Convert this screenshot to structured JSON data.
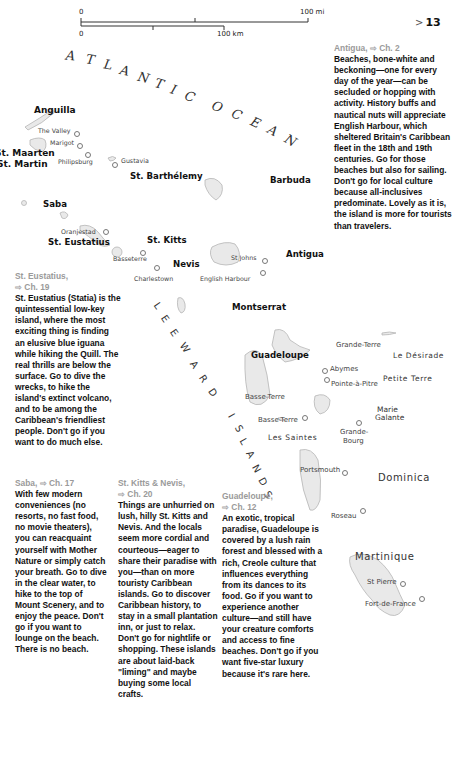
{
  "scale_bar": {
    "miles_start": "0",
    "miles_end": "100 mi",
    "km_start": "0",
    "km_end": "100 km"
  },
  "page_number": {
    "arrow": ">",
    "number": "13"
  },
  "water_labels": {
    "ocean_line1": [
      "A",
      "T",
      "L",
      "A",
      "N",
      "T",
      "I",
      "C"
    ],
    "ocean_line2": [
      "O",
      "C",
      "E",
      "A",
      "N"
    ],
    "islands_arc_1": [
      "L",
      "E",
      "E",
      "W",
      "A",
      "R",
      "D"
    ],
    "islands_arc_2": [
      "I",
      "S",
      "L",
      "A",
      "N",
      "D",
      "S"
    ]
  },
  "islands": {
    "anguilla": "Anguilla",
    "st_maarten": "St. Maarten",
    "st_martin": "St. Martin",
    "st_barthelemy": "St. Barthélemy",
    "barbuda": "Barbuda",
    "saba": "Saba",
    "st_eustatius": "St. Eustatius",
    "st_kitts": "St. Kitts",
    "nevis": "Nevis",
    "antigua": "Antigua",
    "montserrat": "Montserrat",
    "guadeloupe": "Guadeloupe",
    "grande_terre": "Grande-Terre",
    "le_desirade": "Le Désirade",
    "petite_terre": "Petite Terre",
    "basse_terre_region": "Basse-Terre",
    "marie_galante_1": "Marie",
    "marie_galante_2": "Galante",
    "les_saintes": "Les Saintes",
    "dominica": "Dominica",
    "martinique": "Martinique"
  },
  "towns": {
    "the_valley": "The Valley",
    "marigot": "Marigot",
    "philipsburg": "Philipsburg",
    "gustavia": "Gustavia",
    "oranjestad": "Oranjestad",
    "basseterre": "Basseterre",
    "charlestown": "Charlestown",
    "st_johns": "St Johns",
    "english_harbour": "English Harbour",
    "abymes": "Abymes",
    "pointe_a_pitre": "Pointe-à-Pitre",
    "basse_terre_town": "Basse-Terre",
    "grande_bourg_1": "Grande-",
    "grande_bourg_2": "Bourg",
    "portsmouth": "Portsmouth",
    "roseau": "Roseau",
    "st_pierre": "St Pierre",
    "fort_de_france": "Fort-de-France"
  },
  "descriptions": {
    "antigua": {
      "title": "Antigua,",
      "chapter": "Ch. 2",
      "text": "Beaches, bone-white and beckoning—one for every day of the year—can be secluded or hopping with activity. History buffs and nautical nuts will appreciate English Harbour, which sheltered Britain's Caribbean fleet in the 18th and 19th centuries. Go for those beaches but also for sailing. Don't go for local culture because all-inclusives predominate. Lovely as it is, the island is more for tourists than travelers."
    },
    "st_eustatius": {
      "title": "St. Eustatius,",
      "chapter": "Ch. 19",
      "text": "St. Eustatius (Statia) is the quintessential low-key island, where the most exciting thing is finding an elusive blue iguana while hiking the Quill. The real thrills are below the surface. Go to dive the wrecks, to hike the island's extinct volcano, and to be among the Caribbean's friendliest people. Don't go if you want to do much else."
    },
    "saba": {
      "title": "Saba,",
      "chapter": "Ch. 17",
      "text": "With few modern conveniences (no resorts, no fast food, no movie theaters), you can reacquaint yourself with Mother Nature or simply catch your breath. Go to dive in the clear water, to hike to the top of Mount Scenery, and to enjoy the peace. Don't go if you want to lounge on the beach. There is no beach."
    },
    "st_kitts_nevis": {
      "title": "St. Kitts & Nevis,",
      "chapter": "Ch. 20",
      "text": "Things are unhurried on lush, hilly St. Kitts and Nevis. And the locals seem more cordial and courteous—eager to share their paradise with you—than on more touristy Caribbean islands. Go to discover Caribbean history, to stay in a small plantation inn, or just to relax. Don't go for nightlife or shopping. These islands are about laid-back \"liming\" and maybe buying some local crafts."
    },
    "guadeloupe": {
      "title": "Guadeloupe,",
      "chapter": "Ch. 12",
      "text": "An exotic, tropical paradise, Guadeloupe is covered by a lush rain forest and blessed with a rich, Creole culture that influences everything from its dances to its food. Go if you want to experience another culture—and still have your creature comforts and access to fine beaches. Don't go if you want five-star luxury because it's rare here."
    }
  },
  "colors": {
    "land_fill": "#e9e9e9",
    "land_border": "#b5b5b5",
    "heading_gray": "#9a9a9a",
    "body_text": "#111111"
  }
}
